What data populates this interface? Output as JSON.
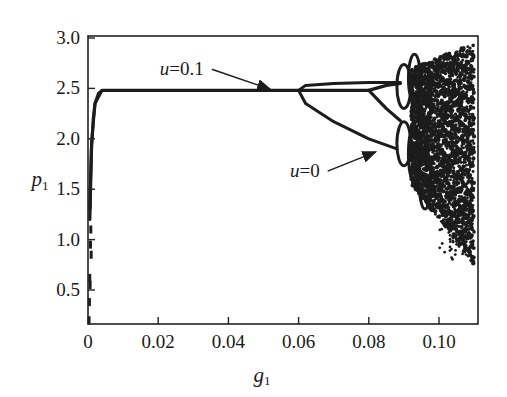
{
  "chart_data": {
    "type": "scatter",
    "title": "",
    "subtitle": "",
    "xlabel": "g",
    "xlabel_sub": "1",
    "ylabel": "p",
    "ylabel_sub": "1",
    "xlim": [
      0,
      0.11
    ],
    "ylim": [
      0.15,
      3.0
    ],
    "x_ticks": [
      0,
      0.02,
      0.04,
      0.06,
      0.08,
      0.1
    ],
    "x_tick_labels": [
      "0",
      "0.02",
      "0.04",
      "0.06",
      "0.08",
      "0.10"
    ],
    "y_ticks": [
      0.5,
      1.0,
      1.5,
      2.0,
      2.5,
      3.0
    ],
    "y_tick_labels": [
      "0.5",
      "1.0",
      "1.5",
      "2.0",
      "2.5",
      "3.0"
    ],
    "grid": false,
    "legend": null,
    "annotations": [
      {
        "text_var": "u",
        "text_val": "=0.1",
        "x": 0.033,
        "y": 2.63,
        "arrow_to": [
          0.052,
          2.49
        ]
      },
      {
        "text_var": "u",
        "text_val": "=0",
        "x": 0.066,
        "y": 1.62,
        "arrow_to": [
          0.082,
          1.87
        ]
      }
    ],
    "series": [
      {
        "name": "u=0.1",
        "description": "Steady state rises steeply near g1≈0 to a plateau p1≈2.48, then a period-doubling at g1≈0.080",
        "branches": [
          {
            "x": [
              0.0005,
              0.001,
              0.0015,
              0.002,
              0.003,
              0.004,
              0.02,
              0.04,
              0.06,
              0.07,
              0.08
            ],
            "y": [
              1.2,
              1.9,
              2.2,
              2.35,
              2.45,
              2.48,
              2.48,
              2.48,
              2.48,
              2.48,
              2.48
            ]
          },
          {
            "x": [
              0.08,
              0.085,
              0.089
            ],
            "y": [
              2.48,
              2.53,
              2.55
            ]
          },
          {
            "x": [
              0.08,
              0.085,
              0.089
            ],
            "y": [
              2.48,
              2.3,
              2.18
            ]
          }
        ]
      },
      {
        "name": "u=0",
        "description": "Single branch p1≈2.48 bifurcates at g1≈0.060 into upper (≈2.55) and lower (falling to ≈1.9 at g1≈0.088) branches, followed by cascade to chaos",
        "branches": [
          {
            "x": [
              0.0005,
              0.001,
              0.002,
              0.004,
              0.02,
              0.04,
              0.06
            ],
            "y": [
              1.3,
              1.95,
              2.35,
              2.48,
              2.48,
              2.48,
              2.48
            ]
          },
          {
            "x": [
              0.06,
              0.062,
              0.07,
              0.08,
              0.089
            ],
            "y": [
              2.48,
              2.53,
              2.55,
              2.56,
              2.56
            ]
          },
          {
            "x": [
              0.06,
              0.062,
              0.07,
              0.08,
              0.088
            ],
            "y": [
              2.48,
              2.35,
              2.17,
              2.0,
              1.9
            ]
          }
        ]
      },
      {
        "name": "transient",
        "description": "Scattered points along g1≈0.001 below the plateau",
        "x": [
          0.0006,
          0.0008,
          0.0007,
          0.0009,
          0.0005,
          0.0006,
          0.0004,
          0.0003
        ],
        "y": [
          1.35,
          1.1,
          0.95,
          0.85,
          0.62,
          0.55,
          0.38,
          0.2
        ]
      },
      {
        "name": "chaotic region",
        "description": "Dense cloud of points from g1≈0.088 to 0.11, spanning p1 ≈ 0.8–2.95",
        "x_range": [
          0.088,
          0.11
        ],
        "y_range": [
          0.8,
          2.95
        ]
      }
    ]
  }
}
